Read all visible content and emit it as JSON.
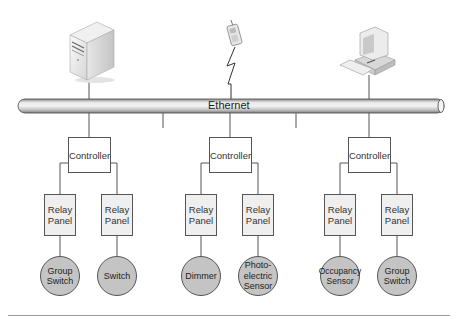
{
  "diagram": {
    "bus": {
      "label": "Ethernet"
    },
    "top_devices": [
      {
        "name": "server",
        "icon": "server-tower-icon"
      },
      {
        "name": "wireless-phone",
        "icon": "mobile-phone-icon",
        "link": "wireless-lightning-icon"
      },
      {
        "name": "workstation",
        "icon": "desktop-computer-icon"
      }
    ],
    "groups": [
      {
        "controller": "Controller",
        "relays": [
          {
            "label": "Relay\nPanel",
            "device": "Group\nSwitch"
          },
          {
            "label": "Relay\nPanel",
            "device": "Switch"
          }
        ]
      },
      {
        "controller": "Controller",
        "relays": [
          {
            "label": "Relay\nPanel",
            "device": "Dimmer"
          },
          {
            "label": "Relay\nPanel",
            "device": "Photo-\nelectric\nSensor"
          }
        ]
      },
      {
        "controller": "Controller",
        "relays": [
          {
            "label": "Relay\nPanel",
            "device": "Occupancy\nSensor"
          },
          {
            "label": "Relay\nPanel",
            "device": "Group\nSwitch"
          }
        ]
      }
    ],
    "colors": {
      "line": "#555555",
      "relay_fill": "#efefef",
      "device_fill": "#c4c4c4",
      "pipe_light": "#f2f2f2",
      "pipe_dark": "#9a9a9a"
    }
  }
}
